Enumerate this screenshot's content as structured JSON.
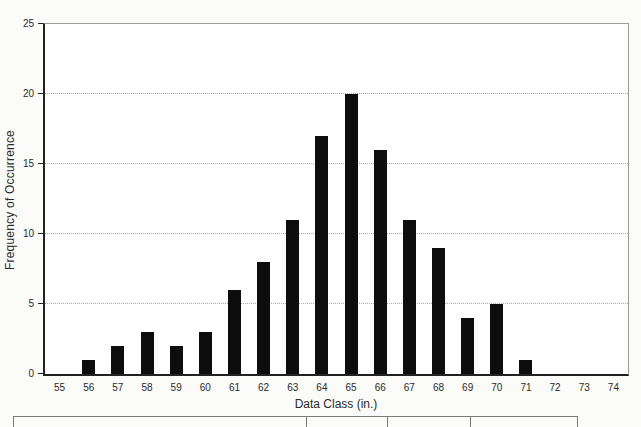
{
  "chart_data": {
    "type": "bar",
    "title": "",
    "xlabel": "Data Class (in.)",
    "ylabel": "Frequency of Occurrence",
    "categories": [
      55,
      56,
      57,
      58,
      59,
      60,
      61,
      62,
      63,
      64,
      65,
      66,
      67,
      68,
      69,
      70,
      71,
      72,
      73,
      74
    ],
    "values": [
      0,
      1,
      2,
      3,
      2,
      3,
      6,
      8,
      11,
      17,
      20,
      16,
      11,
      9,
      4,
      5,
      1,
      0,
      0,
      0
    ],
    "ylim": [
      0,
      25
    ],
    "yticks": [
      0,
      5,
      10,
      15,
      20,
      25
    ],
    "gridline_values": [
      5,
      10,
      15,
      20
    ],
    "grid": "horizontal dotted",
    "legend": "none",
    "bar_width_px": 13
  },
  "colors": {
    "bar": "#0d0d0d",
    "axis": "#222222",
    "frame": "#9a9a9a",
    "gridline": "#a8a8a8",
    "table_border": "#7a7a7a",
    "background": "#fbfbfa"
  },
  "partial_table": {
    "visible_columns": 4,
    "has_text": false
  }
}
